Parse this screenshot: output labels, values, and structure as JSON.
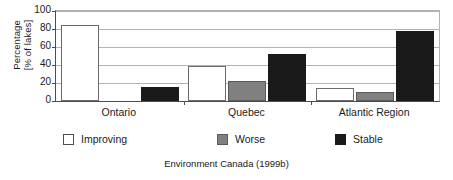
{
  "chart_data": {
    "type": "bar",
    "title": "",
    "subtitle": "",
    "categories": [
      "Ontario",
      "Quebec",
      "Atlantic Region"
    ],
    "series": [
      {
        "name": "Improving",
        "color": "#ffffff",
        "values": [
          85,
          39,
          14
        ]
      },
      {
        "name": "Worse",
        "color": "#808080",
        "values": [
          0,
          22,
          10
        ]
      },
      {
        "name": "Stable",
        "color": "#1a1a1a",
        "values": [
          16,
          52,
          78
        ]
      }
    ],
    "xlabel": "",
    "ylabel": "Percentage [% of lakes]",
    "ylabel_lines": [
      "Percentage",
      "[% of lakes]"
    ],
    "ylim": [
      0,
      100
    ],
    "yticks": [
      0,
      20,
      40,
      60,
      80,
      100
    ],
    "ytick_labels": [
      "0",
      "20",
      "40",
      "60",
      "80",
      "100"
    ],
    "grid": true,
    "grid_axis": "y",
    "legend_position": "bottom",
    "annotations": [
      "Environment Canada (1999b)"
    ]
  },
  "axes": {
    "y_title_line1": "Percentage",
    "y_title_line2": "[% of lakes]"
  },
  "legend": {
    "entries": [
      {
        "label": "Improving",
        "swatch": "improving"
      },
      {
        "label": "Worse",
        "swatch": "worse"
      },
      {
        "label": "Stable",
        "swatch": "stable"
      }
    ]
  },
  "caption": {
    "text": "Environment Canada (1999b)"
  }
}
